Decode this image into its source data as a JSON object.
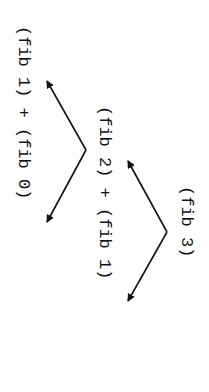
{
  "diagram": {
    "orientation": "rotated-90-clockwise",
    "levels": [
      {
        "level": 0,
        "expression": "(fib 3)"
      },
      {
        "level": 1,
        "expression": "(fib 2) + (fib 1)"
      },
      {
        "level": 2,
        "expression": "(fib 1) + (fib 0)"
      }
    ],
    "edges": [
      {
        "from": "(fib 3)",
        "to": "(fib 2)"
      },
      {
        "from": "(fib 3)",
        "to": "(fib 1)"
      },
      {
        "from": "(fib 2)",
        "to": "(fib 1)"
      },
      {
        "from": "(fib 2)",
        "to": "(fib 0)"
      }
    ],
    "colors": {
      "ink": "#111111",
      "background": "#ffffff"
    }
  }
}
